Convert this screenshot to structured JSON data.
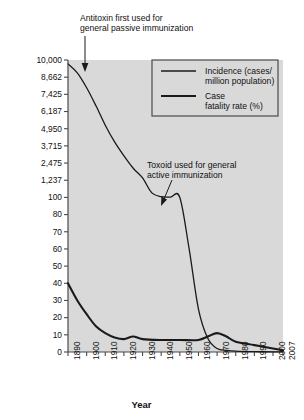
{
  "chart_data": {
    "type": "line",
    "title": "",
    "xlabel": "Year",
    "ylabel": "",
    "grid": false,
    "legend_position": "top-right",
    "x_ticks": [
      "1890",
      "1900",
      "1910",
      "1920",
      "1930",
      "1940",
      "1950",
      "1960",
      "1970",
      "1980",
      "1990",
      "2000",
      "2007"
    ],
    "y_ticks": [
      "10,000",
      "8,662",
      "7,425",
      "6,187",
      "4,950",
      "3,715",
      "2,475",
      "1,237",
      "100",
      "80",
      "70",
      "60",
      "50",
      "40",
      "30",
      "20",
      "10",
      "0"
    ],
    "y_axis_note": "broken / dual-scale axis: upper segment 1,237-10,000 (incidence), lower segment 0-100",
    "series": [
      {
        "name": "Incidence (cases/\nmillion population)",
        "legend_key": "incidence",
        "stroke_width": 1.3,
        "x": [
          1890,
          1895,
          1900,
          1905,
          1910,
          1915,
          1920,
          1925,
          1930,
          1935,
          1940,
          1945,
          1950,
          1955,
          1960,
          1965,
          1970,
          1975,
          1980,
          1990,
          2000,
          2007
        ],
        "values": [
          9700,
          9000,
          7900,
          6600,
          5200,
          4000,
          3000,
          2100,
          1400,
          400,
          150,
          120,
          100,
          60,
          25,
          8,
          2,
          1,
          0.5,
          0.2,
          0.1,
          0.05
        ]
      },
      {
        "name": "Case\nfatality rate (%)",
        "legend_key": "case-fatality",
        "stroke_width": 2.1,
        "x": [
          1890,
          1895,
          1900,
          1905,
          1910,
          1915,
          1920,
          1925,
          1930,
          1940,
          1950,
          1960,
          1965,
          1970,
          1975,
          1980,
          1990,
          2000,
          2007
        ],
        "values": [
          40,
          30,
          22,
          15,
          11,
          8.5,
          7.5,
          9,
          7.5,
          7,
          7,
          7,
          9,
          11,
          9,
          6,
          4,
          2,
          1
        ]
      }
    ],
    "annotations": [
      {
        "id": "antitoxin",
        "text": "Antitoxin first used for\ngeneral passive immunization",
        "target_year": 1894,
        "arrow": "down"
      },
      {
        "id": "toxoid",
        "text": "Toxoid used for general\nactive immunization",
        "target_year": 1942,
        "arrow": "down-left"
      }
    ],
    "colors": {
      "plot_background": "#d9d9d9",
      "line": "#1a1a1a",
      "axis": "#555555",
      "text": "#111111",
      "legend_background": "#d9d9d9",
      "legend_border": "#4a4a4a"
    }
  },
  "legend": {
    "items": [
      {
        "label": "Incidence (cases/\nmillion population)"
      },
      {
        "label": "Case\nfatality rate (%)"
      }
    ]
  },
  "axis_title": "Year"
}
